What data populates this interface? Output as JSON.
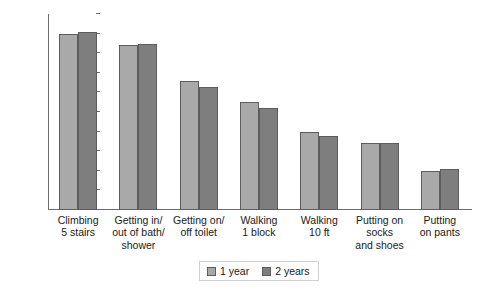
{
  "chart_data": {
    "type": "bar",
    "title": "",
    "xlabel": "",
    "ylabel": "",
    "ylim": [
      0,
      100
    ],
    "yticks": [
      0,
      10,
      20,
      30,
      40,
      50,
      60,
      70,
      80,
      90,
      100
    ],
    "grid": false,
    "legend_position": "bottom",
    "categories": [
      "Climbing\n5 stairs",
      "Getting in/\nout of bath/\nshower",
      "Getting on/\noff toilet",
      "Walking\n1 block",
      "Walking\n10 ft",
      "Putting on socks\nand shoes",
      "Putting\non pants"
    ],
    "series": [
      {
        "name": "1 year",
        "color": "#a9a9a9",
        "values": [
          90,
          84,
          66,
          55,
          40,
          34,
          20
        ]
      },
      {
        "name": "2 years",
        "color": "#7e7e7e",
        "values": [
          91,
          84.5,
          63,
          52,
          38,
          34,
          21
        ]
      }
    ]
  },
  "legend": {
    "items": [
      {
        "label": "1 year"
      },
      {
        "label": "2 years"
      }
    ]
  },
  "colors": {
    "series_1_year": "#a9a9a9",
    "series_2_years": "#7e7e7e",
    "axis": "#6e6e6e",
    "bar_border": "#5d5d5d",
    "background": "#ffffff"
  }
}
